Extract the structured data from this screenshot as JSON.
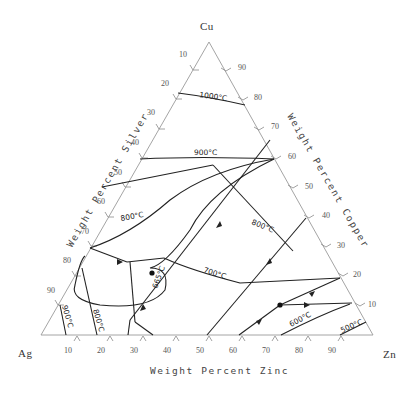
{
  "diagram": {
    "type": "ternary phase diagram",
    "corners": {
      "top": "Cu",
      "left": "Ag",
      "right": "Zn"
    },
    "axis_titles": {
      "left": "Weight Percent Silver",
      "right": "Weight Percent Copper",
      "bottom": "Weight Percent Zinc"
    },
    "left_ticks": [
      "10",
      "20",
      "30",
      "40",
      "50",
      "60",
      "70",
      "80",
      "90"
    ],
    "right_ticks": [
      "90",
      "80",
      "70",
      "60",
      "50",
      "40",
      "30",
      "20",
      "10"
    ],
    "bottom_ticks": [
      "10",
      "20",
      "30",
      "40",
      "50",
      "60",
      "70",
      "80",
      "90"
    ],
    "isotherms": {
      "t1000": "1000°C",
      "t900": "900°C",
      "t800_left": "800°C",
      "t800_right": "800°C",
      "t700": "700°C",
      "t665": "665°C",
      "t900_low": "900°C",
      "t800_low": "800°C",
      "t600": "600°C",
      "t500": "500°C"
    },
    "colors": {
      "axis": "#9a9a9a",
      "curve": "#222222",
      "text": "#444444"
    }
  }
}
